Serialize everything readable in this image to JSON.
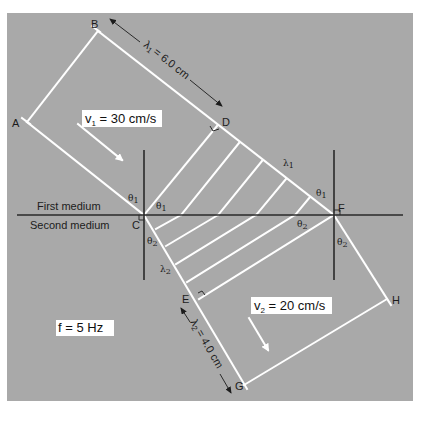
{
  "figure": {
    "panel_color": "#a9a9a9",
    "wavefront_color": "#ffffff",
    "line_color": "#2a2a2a"
  },
  "points": {
    "A": "A",
    "B": "B",
    "C": "C",
    "D": "D",
    "E": "E",
    "F": "F",
    "G": "G",
    "H": "H"
  },
  "media": {
    "first": "First medium",
    "second": "Second medium"
  },
  "angles": {
    "theta1": "θ",
    "theta1_sub": "1",
    "theta2": "θ",
    "theta2_sub": "2"
  },
  "wavelengths": {
    "lambda1_symbol": "λ",
    "lambda1_sub": "1",
    "lambda2_symbol": "λ",
    "lambda2_sub": "2",
    "lambda1_dimension": "= 6.0 cm",
    "lambda2_dimension": "= 4.0 cm"
  },
  "info_boxes": {
    "v1_symbol": "v",
    "v1_sub": "1",
    "v1_value": " = 30 cm/s",
    "v2_symbol": "v",
    "v2_sub": "2",
    "v2_value": " = 20 cm/s",
    "frequency": "f = 5 Hz"
  }
}
